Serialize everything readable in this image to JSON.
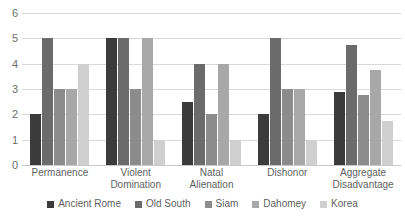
{
  "chart_data": {
    "type": "bar",
    "title": "",
    "subtitle": "",
    "xlabel": "",
    "ylabel": "",
    "ylim": [
      0,
      6
    ],
    "yticks": [
      0,
      1,
      2,
      3,
      4,
      5,
      6
    ],
    "grid": true,
    "legend_position": "bottom",
    "categories": [
      "Permanence",
      "Violent Domination",
      "Natal Alienation",
      "Dishonor",
      "Aggregate Disadvantage"
    ],
    "category_lines": [
      [
        "Permanence"
      ],
      [
        "Violent",
        "Domination"
      ],
      [
        "Natal",
        "Alienation"
      ],
      [
        "Dishonor"
      ],
      [
        "Aggregate",
        "Disadvantage"
      ]
    ],
    "series": [
      {
        "name": "Ancient Rome",
        "color": "#3b3b3b",
        "values": [
          2,
          5,
          2.5,
          2,
          2.9
        ]
      },
      {
        "name": "Old South",
        "color": "#6b6b6b",
        "values": [
          5,
          5,
          4,
          5,
          4.75
        ]
      },
      {
        "name": "Siam",
        "color": "#8c8c8c",
        "values": [
          3,
          3,
          2,
          3,
          2.75
        ]
      },
      {
        "name": "Dahomey",
        "color": "#a8a8a8",
        "values": [
          3,
          5,
          4,
          3,
          3.75
        ]
      },
      {
        "name": "Korea",
        "color": "#cfcfcf",
        "values": [
          4,
          1,
          1,
          1,
          1.75
        ]
      }
    ]
  }
}
